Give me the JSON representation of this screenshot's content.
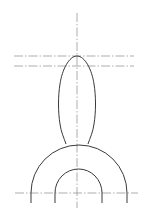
{
  "drawing": {
    "title": "",
    "colors": {
      "outline": "#3a3a3a",
      "centerline": "#8a8a8a",
      "background": "#ffffff"
    },
    "elements": [
      "vertical-centerline",
      "upper-horizontal-centerline",
      "lower-horizontal-centerline",
      "base-horizontal-centerline",
      "bulb-profile",
      "outer-arch",
      "inner-arch"
    ]
  }
}
